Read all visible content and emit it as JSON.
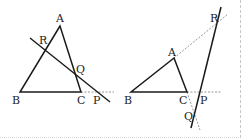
{
  "colors": {
    "line": "#1a1a1a",
    "dashed": "#8a8a8a",
    "border": "#c8c8c8",
    "label": "#222222"
  },
  "figures": [
    {
      "name": "left-figure",
      "labels": {
        "A": "A",
        "B": "B",
        "C": "C",
        "P": "P",
        "Q": "Q",
        "R": "R"
      }
    },
    {
      "name": "right-figure",
      "labels": {
        "A": "A",
        "B": "B",
        "C": "C",
        "P": "P",
        "Q": "Q",
        "R": "R"
      }
    }
  ]
}
